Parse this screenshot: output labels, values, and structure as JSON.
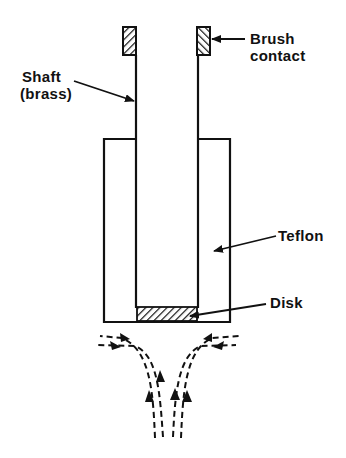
{
  "diagram": {
    "type": "rotating disk electrode cross-section",
    "labels": {
      "brush_line1": "Brush",
      "brush_line2": "contact",
      "shaft_line1": "Shaft",
      "shaft_line2": "(brass)",
      "teflon": "Teflon",
      "disk": "Disk"
    },
    "colors": {
      "ink": "#111111",
      "background": "#ffffff"
    }
  }
}
